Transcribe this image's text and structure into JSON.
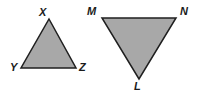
{
  "figure": {
    "background_color": "#ffffff",
    "fill_color": "#a8a8a8",
    "stroke_color": "#1f1f1f",
    "stroke_width": 1.5,
    "shapes": [
      {
        "name": "triangle-xyz",
        "orientation": "upright",
        "points": "49,19 76,68 21,68",
        "vertices": [
          {
            "label": "X",
            "x": 49,
            "y": 19,
            "label_x": 39,
            "label_y": 7
          },
          {
            "label": "Y",
            "x": 21,
            "y": 68,
            "label_x": 10,
            "label_y": 62
          },
          {
            "label": "Z",
            "x": 76,
            "y": 68,
            "label_x": 79,
            "label_y": 62
          }
        ]
      },
      {
        "name": "triangle-mnl",
        "orientation": "inverted",
        "points": "102,18 176,18 139,79",
        "vertices": [
          {
            "label": "M",
            "x": 102,
            "y": 18,
            "label_x": 87,
            "label_y": 6
          },
          {
            "label": "N",
            "x": 176,
            "y": 18,
            "label_x": 180,
            "label_y": 6
          },
          {
            "label": "L",
            "x": 139,
            "y": 79,
            "label_x": 134,
            "label_y": 81
          }
        ]
      }
    ]
  }
}
